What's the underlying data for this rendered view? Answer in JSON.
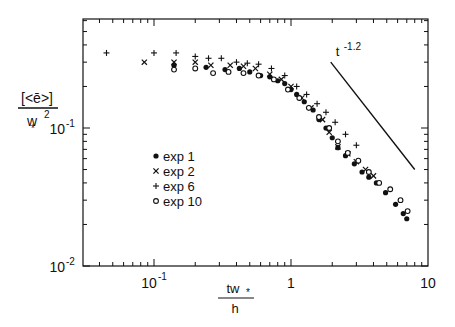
{
  "chart_data": {
    "type": "scatter",
    "title": "",
    "xlabel": "tw*/h",
    "ylabel": "[<ē>]/w*^2",
    "xscale": "log",
    "yscale": "log",
    "xlim": [
      0.03,
      10
    ],
    "ylim": [
      0.01,
      0.62
    ],
    "x_ticks": [
      {
        "value": 0.1,
        "label": "10",
        "sup": "-1"
      },
      {
        "value": 1,
        "label": "1",
        "sup": ""
      },
      {
        "value": 10,
        "label": "10",
        "sup": ""
      }
    ],
    "y_ticks": [
      {
        "value": 0.1,
        "label": "10",
        "sup": "-1"
      },
      {
        "value": 0.01,
        "label": "10",
        "sup": "-2"
      }
    ],
    "grid": false,
    "legend_position": "inside-left-center",
    "series": [
      {
        "name": "exp 1",
        "marker": "filled-circle",
        "points": [
          [
            0.14,
            0.285
          ],
          [
            0.24,
            0.275
          ],
          [
            0.33,
            0.265
          ],
          [
            0.42,
            0.27
          ],
          [
            0.5,
            0.255
          ],
          [
            0.6,
            0.24
          ],
          [
            0.7,
            0.235
          ],
          [
            0.8,
            0.22
          ],
          [
            0.9,
            0.21
          ],
          [
            1.0,
            0.19
          ],
          [
            1.1,
            0.175
          ],
          [
            1.25,
            0.155
          ],
          [
            1.45,
            0.135
          ],
          [
            1.6,
            0.115
          ],
          [
            1.8,
            0.1
          ],
          [
            2.0,
            0.085
          ],
          [
            2.2,
            0.072
          ],
          [
            2.5,
            0.063
          ],
          [
            2.9,
            0.055
          ],
          [
            3.3,
            0.048
          ],
          [
            3.7,
            0.044
          ],
          [
            4.2,
            0.04
          ],
          [
            4.9,
            0.034
          ],
          [
            5.8,
            0.028
          ],
          [
            6.6,
            0.024
          ],
          [
            7.0,
            0.022
          ]
        ]
      },
      {
        "name": "exp 2",
        "marker": "x",
        "points": [
          [
            0.085,
            0.3
          ],
          [
            0.14,
            0.3
          ],
          [
            0.2,
            0.3
          ],
          [
            0.26,
            0.285
          ],
          [
            0.36,
            0.285
          ],
          [
            0.45,
            0.28
          ],
          [
            0.55,
            0.27
          ],
          [
            0.7,
            0.245
          ],
          [
            0.85,
            0.225
          ],
          [
            1.0,
            0.2
          ],
          [
            1.2,
            0.165
          ],
          [
            1.4,
            0.14
          ],
          [
            1.7,
            0.115
          ],
          [
            1.9,
            0.093
          ],
          [
            2.2,
            0.073
          ],
          [
            2.6,
            0.065
          ],
          [
            3.0,
            0.057
          ],
          [
            3.5,
            0.05
          ],
          [
            4.0,
            0.045
          ]
        ]
      },
      {
        "name": "exp 6",
        "marker": "plus",
        "points": [
          [
            0.045,
            0.35
          ],
          [
            0.1,
            0.35
          ],
          [
            0.145,
            0.35
          ],
          [
            0.2,
            0.33
          ],
          [
            0.25,
            0.32
          ],
          [
            0.31,
            0.32
          ],
          [
            0.4,
            0.3
          ],
          [
            0.48,
            0.295
          ],
          [
            0.58,
            0.29
          ],
          [
            0.72,
            0.27
          ],
          [
            0.9,
            0.24
          ],
          [
            1.1,
            0.2
          ],
          [
            1.3,
            0.175
          ],
          [
            1.55,
            0.15
          ],
          [
            1.8,
            0.13
          ],
          [
            2.1,
            0.11
          ],
          [
            2.5,
            0.09
          ],
          [
            3.0,
            0.075
          ]
        ]
      },
      {
        "name": "exp 10",
        "marker": "open-circle",
        "points": [
          [
            0.14,
            0.265
          ],
          [
            0.2,
            0.27
          ],
          [
            0.27,
            0.25
          ],
          [
            0.35,
            0.255
          ],
          [
            0.45,
            0.25
          ],
          [
            0.58,
            0.24
          ],
          [
            0.75,
            0.225
          ],
          [
            0.95,
            0.19
          ],
          [
            1.15,
            0.165
          ],
          [
            1.35,
            0.14
          ],
          [
            1.6,
            0.12
          ],
          [
            1.9,
            0.1
          ],
          [
            2.2,
            0.08
          ],
          [
            2.6,
            0.066
          ],
          [
            3.1,
            0.058
          ],
          [
            3.7,
            0.048
          ],
          [
            4.4,
            0.04
          ],
          [
            5.3,
            0.036
          ],
          [
            6.3,
            0.03
          ],
          [
            7.1,
            0.025
          ]
        ]
      }
    ],
    "annotations": [
      {
        "type": "line",
        "label": "t^-1.2",
        "text": "t",
        "sup": "-1.2",
        "from": [
          1.95,
          0.3
        ],
        "to": [
          8.0,
          0.05
        ]
      }
    ],
    "legend": [
      {
        "label": "exp  1",
        "marker": "filled-circle"
      },
      {
        "label": "exp  2",
        "marker": "x"
      },
      {
        "label": "exp  6",
        "marker": "plus"
      },
      {
        "label": "exp 10",
        "marker": "open-circle"
      }
    ]
  }
}
